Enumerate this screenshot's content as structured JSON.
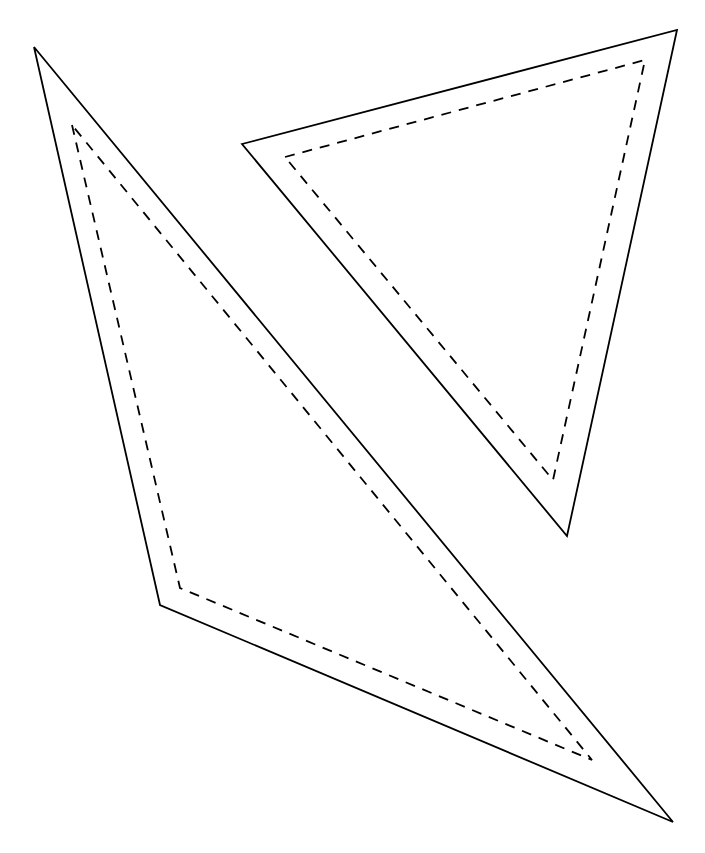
{
  "diagram": {
    "background": "#ffffff",
    "stroke_color": "#000000",
    "shapes": [
      {
        "name": "left-triangle",
        "outer_points": "34,47 160,605 673,822",
        "inner_dashed_points": "72,125 180,588 592,760"
      },
      {
        "name": "right-triangle",
        "outer_points": "242,144 677,30 567,536",
        "inner_dashed_points": "285,157 645,60 553,480"
      }
    ]
  }
}
